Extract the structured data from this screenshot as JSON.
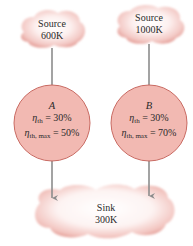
{
  "diagram": {
    "type": "heat-engine-comparison",
    "colors": {
      "cloud_fill": "#f3c9c5",
      "cloud_edge": "#d9736c",
      "engine_fill": "#f2b9b2",
      "engine_stroke": "#c96a62",
      "arrow": "#8c8c8c",
      "text": "#2a2a2a"
    },
    "sources": [
      {
        "id": "source-a",
        "title": "Source",
        "temperature": "600K"
      },
      {
        "id": "source-b",
        "title": "Source",
        "temperature": "1000K"
      }
    ],
    "engines": [
      {
        "id": "engine-a",
        "name": "A",
        "eta_th_label": "η",
        "eta_th_sub": "th",
        "eta_th_value": "= 30%",
        "eta_max_label": "η",
        "eta_max_sub": "th, max",
        "eta_max_value": "= 50%"
      },
      {
        "id": "engine-b",
        "name": "B",
        "eta_th_label": "η",
        "eta_th_sub": "th",
        "eta_th_value": "= 30%",
        "eta_max_label": "η",
        "eta_max_sub": "th, max",
        "eta_max_value": "= 70%"
      }
    ],
    "sink": {
      "title": "Sink",
      "temperature": "300K"
    },
    "arrows": [
      {
        "from": "source-a",
        "to": "engine-a"
      },
      {
        "from": "source-b",
        "to": "engine-b"
      },
      {
        "from": "engine-a",
        "to": "sink"
      },
      {
        "from": "engine-b",
        "to": "sink"
      }
    ]
  }
}
